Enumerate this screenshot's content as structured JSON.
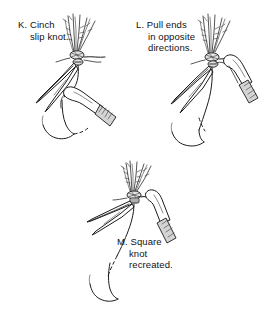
{
  "figure": {
    "background_color": "#ffffff",
    "ink_color": "#1c1c1c",
    "panels": [
      {
        "id": "K",
        "name": "panel-k",
        "caption_line1": "K. Cinch",
        "caption_line2": "slip knot.",
        "elements": [
          "suture-strands-fan",
          "knot-core",
          "forceps-tip-left",
          "needle-holder-right",
          "suture-loop",
          "curved-needle"
        ]
      },
      {
        "id": "L",
        "name": "panel-l",
        "caption_line1": "L. Pull ends",
        "caption_line2": "in opposite",
        "caption_line3": "directions.",
        "elements": [
          "suture-strands-fan",
          "knot-core",
          "forceps-tip-left",
          "needle-holder-right",
          "suture-loop",
          "curved-needle"
        ]
      },
      {
        "id": "M",
        "name": "panel-m",
        "caption_line1": "M. Square",
        "caption_line2": "knot",
        "caption_line3": "recreated.",
        "elements": [
          "suture-strands-fan",
          "square-knot-core",
          "forceps-tip-left",
          "needle-holder-right",
          "suture-loop",
          "curved-needle"
        ]
      }
    ]
  }
}
